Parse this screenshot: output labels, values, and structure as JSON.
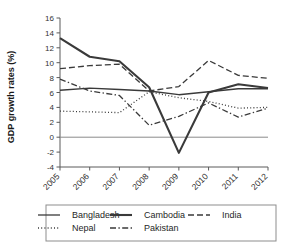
{
  "chart_data": {
    "type": "line",
    "title": "",
    "xlabel": "",
    "ylabel": "GDP growth rates (%)",
    "categories": [
      "2005",
      "2006",
      "2007",
      "2008",
      "2009",
      "2010",
      "2011",
      "2012"
    ],
    "x": [
      2005,
      2006,
      2007,
      2008,
      2009,
      2010,
      2011,
      2012
    ],
    "ylim": [
      -4,
      16
    ],
    "yticks": [
      -4,
      -2,
      0,
      2,
      4,
      6,
      8,
      10,
      12,
      14,
      16
    ],
    "yticklabels": [
      "-4",
      "-2",
      "0",
      "2",
      "4",
      "6",
      "8",
      "10",
      "12",
      "14",
      "16"
    ],
    "grid": false,
    "legend_position": "bottom",
    "zero_line": 0,
    "series": [
      {
        "name": "Bangladesh",
        "style": "solid",
        "width": 1.3,
        "color": "#3a3a3a",
        "values": [
          6.3,
          6.6,
          6.4,
          6.2,
          5.7,
          6.1,
          6.5,
          6.5
        ]
      },
      {
        "name": "Cambodia",
        "style": "solid",
        "width": 2.1,
        "color": "#3a3a3a",
        "values": [
          13.3,
          10.8,
          10.2,
          6.7,
          -2.1,
          6.0,
          7.1,
          6.6
        ]
      },
      {
        "name": "India",
        "style": "dashed",
        "width": 1.3,
        "color": "#3a3a3a",
        "values": [
          9.2,
          9.6,
          9.8,
          6.2,
          6.8,
          10.3,
          8.3,
          7.9
        ]
      },
      {
        "name": "Nepal",
        "style": "dotted",
        "width": 1.3,
        "color": "#3a3a3a",
        "values": [
          3.5,
          3.4,
          3.3,
          6.1,
          5.3,
          4.8,
          3.9,
          4.0
        ]
      },
      {
        "name": "Pakistan",
        "style": "dashdot",
        "width": 1.3,
        "color": "#3a3a3a",
        "values": [
          7.8,
          6.2,
          5.6,
          1.6,
          2.8,
          4.6,
          2.7,
          3.9
        ]
      }
    ]
  },
  "legend": {
    "entries": [
      {
        "label": "Bangladesh",
        "style": "solid"
      },
      {
        "label": "Cambodia",
        "style": "solid-thick"
      },
      {
        "label": "India",
        "style": "dashed"
      },
      {
        "label": "Nepal",
        "style": "dotted"
      },
      {
        "label": "Pakistan",
        "style": "dashdot"
      }
    ]
  }
}
